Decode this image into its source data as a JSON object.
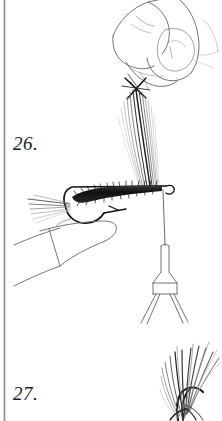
{
  "figure": {
    "type": "instructional-line-drawing",
    "background_color": "#ffffff",
    "ink_color": "#1c1c1c",
    "light_ink_color": "#9a9a9a",
    "rule_color": "#8c8c8c"
  },
  "steps": [
    {
      "id": "step-26",
      "label": "26.",
      "description": "Hand pinching a bundle of hackle fibers upright above the hook shank held in a vise, thread hanging from bobbin",
      "elements": [
        "hand-fingers",
        "fiber-bundle",
        "hook",
        "dubbed-body",
        "tail-fibers",
        "vise-jaws",
        "thread",
        "bobbin"
      ]
    },
    {
      "id": "step-27",
      "label": "27.",
      "description": "Splayed hackle fiber bundle",
      "elements": [
        "feather-fibers"
      ]
    }
  ],
  "margin_rule": {
    "name": "left-margin-rule",
    "orientation": "vertical"
  }
}
